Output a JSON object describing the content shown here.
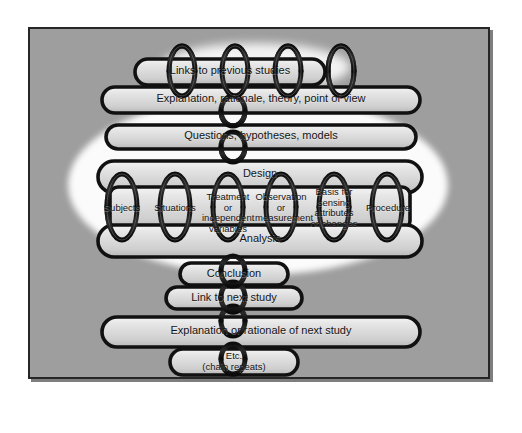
{
  "diagram": {
    "panel_color": "#9e9e9e",
    "border_color": "#262626",
    "link_color": "#141414",
    "bar_face_color": "#d8d8d8",
    "halo_color": "#fbfbfb",
    "text_color": "#141414"
  },
  "links": [
    {
      "id": "links-to-previous-studies",
      "label": "Links to previous studies"
    },
    {
      "id": "explanation-rationale",
      "label": "Explanation, rationale, theory, point of view"
    },
    {
      "id": "questions-hypotheses-models",
      "label": "Questions, hypotheses, models"
    },
    {
      "id": "design",
      "label": "Design"
    },
    {
      "id": "analysis",
      "label": "Analysis"
    },
    {
      "id": "conclusion",
      "label": "Conclusion"
    },
    {
      "id": "link-to-next-study",
      "label": "Link to next study"
    },
    {
      "id": "explanation-next-study",
      "label": "Explanation or rationale of next study"
    },
    {
      "id": "etc-chain-repeats",
      "label": "Etc.\n(chain repeats)",
      "line1": "Etc.",
      "line2": "(chain repeats)"
    }
  ],
  "design_components": [
    {
      "id": "subjects",
      "label": "Subjects",
      "lines": [
        "Subjects"
      ]
    },
    {
      "id": "situations",
      "label": "Situations",
      "lines": [
        "Situations"
      ]
    },
    {
      "id": "treatment-independent-variables",
      "label": "Treatment or independent variables",
      "lines": [
        "Treatment or",
        "independent",
        "variables"
      ]
    },
    {
      "id": "observation-measurement",
      "label": "Observation or measurement",
      "lines": [
        "Observation",
        "or",
        "measurement"
      ]
    },
    {
      "id": "basis-for-sensing",
      "label": "Basis for sensing attributes or changes",
      "lines": [
        "Basis for",
        "sensing",
        "attributes",
        "or changes"
      ]
    },
    {
      "id": "procedure",
      "label": "Procedure",
      "lines": [
        "Procedure"
      ]
    }
  ]
}
